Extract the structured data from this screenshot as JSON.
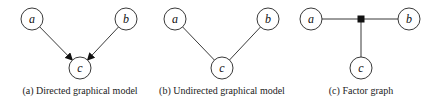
{
  "panels": [
    {
      "id": "a",
      "caption": "(a) Directed graphical model",
      "type": "directed",
      "nodes": [
        {
          "label": "a",
          "x": 32,
          "y": 19
        },
        {
          "label": "b",
          "x": 126,
          "y": 19
        },
        {
          "label": "c",
          "x": 80,
          "y": 68
        }
      ],
      "edges": [
        [
          "a",
          "c"
        ],
        [
          "b",
          "c"
        ]
      ]
    },
    {
      "id": "b",
      "caption": "(b) Undirected graphical model",
      "type": "undirected",
      "nodes": [
        {
          "label": "a",
          "x": 175,
          "y": 19
        },
        {
          "label": "b",
          "x": 268,
          "y": 19
        },
        {
          "label": "c",
          "x": 222,
          "y": 68
        }
      ],
      "edges": [
        [
          "a",
          "c"
        ],
        [
          "b",
          "c"
        ]
      ]
    },
    {
      "id": "c",
      "caption": "(c) Factor graph",
      "type": "factor",
      "nodes": [
        {
          "label": "a",
          "x": 311,
          "y": 19
        },
        {
          "label": "b",
          "x": 409,
          "y": 19
        },
        {
          "label": "c",
          "x": 361,
          "y": 68
        }
      ],
      "factor": {
        "x": 361,
        "y": 19
      },
      "edges": [
        [
          "a",
          "f"
        ],
        [
          "b",
          "f"
        ],
        [
          "c",
          "f"
        ]
      ]
    }
  ],
  "colors": {
    "stroke": "#222222",
    "fill": "#ffffff",
    "factor": "#111111"
  }
}
